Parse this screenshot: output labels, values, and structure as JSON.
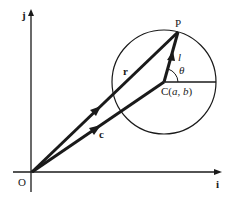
{
  "diagram": {
    "axes": {
      "x_label": "i",
      "y_label": "j",
      "origin_label": "O"
    },
    "points": {
      "P": {
        "label": "P"
      },
      "C": {
        "label": "C(a, b)",
        "label_prefix": "C(",
        "a": "a",
        "sep": ", ",
        "b": "b",
        "label_suffix": ")"
      }
    },
    "vectors": {
      "r": {
        "label": "r",
        "from": "O",
        "to": "P"
      },
      "c": {
        "label": "c",
        "from": "O",
        "to": "C"
      },
      "l": {
        "label": "l",
        "from": "C",
        "to": "P"
      }
    },
    "angle": {
      "label": "θ"
    },
    "colors": {
      "stroke": "#1a1a1a",
      "background": "#ffffff"
    }
  }
}
